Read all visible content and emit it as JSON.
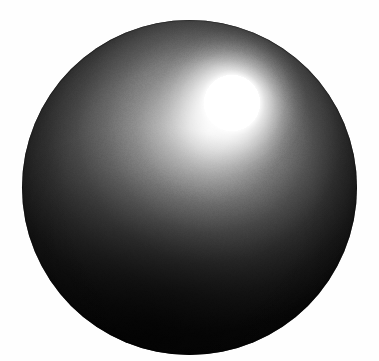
{
  "scene": {
    "title": "Rendered Sphere",
    "width": 379,
    "height": 361,
    "background_color": "#fefefe",
    "description": "A computer-generated shaded sphere on a plain white background with a bright specular highlight in the upper right."
  },
  "sphere": {
    "name": "sphere",
    "center_x": 189,
    "center_y": 182,
    "radius": 167,
    "left": 22,
    "top": 20,
    "right": 357,
    "bottom": 345,
    "diameter": 335,
    "base_color": "#080808",
    "limb_color": "#0a0a0a",
    "midtone_color": "#757575",
    "shadow_color": "#111111",
    "material": "matte-with-specular"
  },
  "highlight": {
    "name": "specular-highlight",
    "center_x": 232,
    "center_y": 103,
    "core_radius": 28,
    "glow_radius": 74,
    "core_color": "#ffffff",
    "light_direction": "upper-right"
  },
  "diffuse": {
    "name": "diffuse-falloff",
    "peak_x": 210,
    "peak_y": 130,
    "spread_radius": 230,
    "direction": "down-left",
    "terminator_color": "#1e1e1e"
  },
  "grain": {
    "name": "render-noise",
    "opacity": 0.085,
    "tile_size": 96
  }
}
